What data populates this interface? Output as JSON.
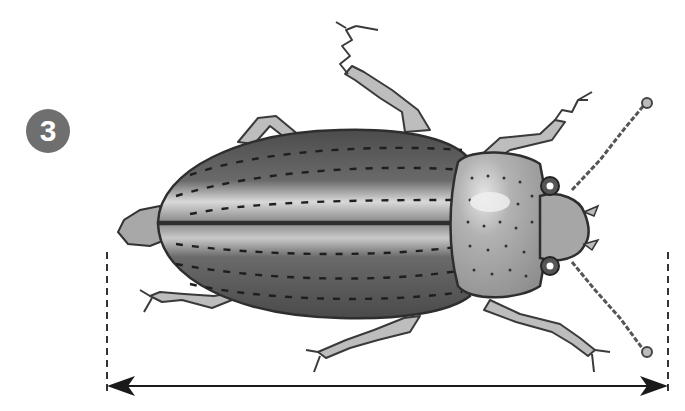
{
  "figure": {
    "step_number": "3",
    "colors": {
      "badge": "#6f6f6f",
      "elytra_dark": "#5a5a5a",
      "elytra_highlight": "#d8d8d8",
      "pronotum": "#a9a9a9",
      "legs": "#b5b5b5",
      "outline": "#2e2e2e",
      "arrow": "#1a1a1a"
    },
    "measurement": {
      "type": "length",
      "start_x": 107,
      "end_x": 668
    }
  }
}
